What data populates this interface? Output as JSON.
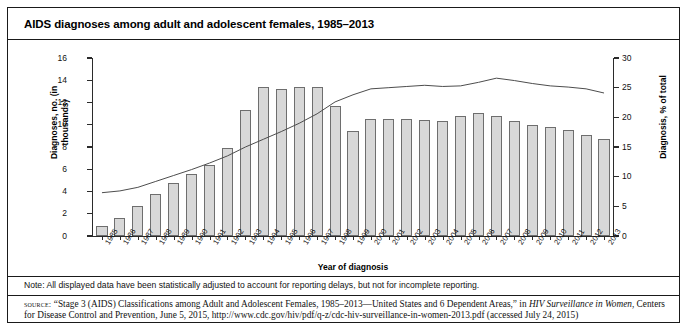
{
  "figure": {
    "title": "AIDS diagnoses among adult and adolescent females, 1985–2013",
    "note": "Note: All displayed data have been statistically adjusted to account for reporting delays, but not for incomplete reporting.",
    "source_label": "source:",
    "source_part1": " “Stage 3 (AIDS) Classifications among Adult and Adolescent Females, 1985–2013—United States and 6 Dependent Areas,” in ",
    "source_italic1": "HIV Surveillance in Women",
    "source_part2": ", Centers for Disease Control and Prevention, June 5, 2015, http://www.cdc.gov/hiv/pdf/q-z/cdc-hiv-surveillance-in-women-2013.pdf (accessed July 24, 2015)"
  },
  "chart_data": {
    "type": "bar",
    "title": "AIDS diagnoses among adult and adolescent females, 1985–2013",
    "xlabel": "Year of diagnosis",
    "ylabel": "Diagnoses, no. (in thousands)",
    "y2label": "Diagnosis, % of total",
    "ylim": [
      0,
      16
    ],
    "y2lim": [
      0,
      30
    ],
    "yticks": [
      0,
      2,
      4,
      6,
      8,
      10,
      12,
      14,
      16
    ],
    "y2ticks": [
      0,
      5,
      10,
      15,
      20,
      25,
      30
    ],
    "grid": false,
    "legend": "none",
    "categories": [
      "1985",
      "1986",
      "1987",
      "1988",
      "1989",
      "1990",
      "1991",
      "1992",
      "1993",
      "1994",
      "1995",
      "1996",
      "1997",
      "1998",
      "1999",
      "2000",
      "2001",
      "2002",
      "2003",
      "2004",
      "2005",
      "2006",
      "2007",
      "2008",
      "2009",
      "2010",
      "2011",
      "2012",
      "2013"
    ],
    "series": [
      {
        "name": "Diagnoses, no. (in thousands)",
        "type": "bar",
        "axis": "left",
        "values": [
          0.9,
          1.6,
          2.7,
          3.8,
          4.8,
          5.6,
          6.4,
          7.9,
          11.3,
          13.4,
          13.2,
          13.4,
          13.4,
          11.7,
          9.4,
          10.5,
          10.5,
          10.5,
          10.4,
          10.3,
          10.8,
          11.1,
          10.8,
          10.3,
          10.0,
          9.8,
          9.5,
          9.1,
          8.7
        ]
      },
      {
        "name": "Diagnosis, % of total",
        "type": "line",
        "axis": "right",
        "values": [
          7.3,
          7.6,
          8.2,
          9.2,
          10.2,
          11.2,
          12.3,
          13.5,
          15.0,
          16.3,
          17.6,
          19.0,
          20.6,
          22.6,
          23.8,
          24.8,
          25.0,
          25.2,
          25.4,
          25.2,
          25.3,
          25.9,
          26.6,
          26.2,
          25.7,
          25.3,
          25.1,
          24.8,
          24.1
        ]
      }
    ],
    "colors": {
      "bar_fill": "#d8d8d8",
      "bar_stroke": "#6e6e6e",
      "line_stroke": "#4d4d4d",
      "axis": "#2b2b2b",
      "frame": "#1a1a1a"
    }
  }
}
